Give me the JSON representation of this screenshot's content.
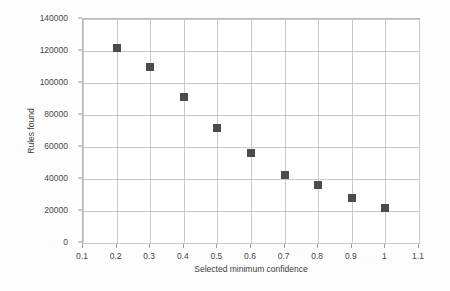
{
  "chart_data": {
    "type": "scatter",
    "title": "",
    "xlabel": "Selected minimum confidence",
    "ylabel": "Rules found",
    "xlim": [
      0.1,
      1.1
    ],
    "ylim": [
      0,
      140000
    ],
    "xticks": [
      "0.1",
      "0.2",
      "0.3",
      "0.4",
      "0.5",
      "0.6",
      "0.7",
      "0.8",
      "0.9",
      "1",
      "1.1"
    ],
    "xtick_values": [
      0.1,
      0.2,
      0.3,
      0.4,
      0.5,
      0.6,
      0.7,
      0.8,
      0.9,
      1.0,
      1.1
    ],
    "yticks": [
      "0",
      "20000",
      "40000",
      "60000",
      "80000",
      "100000",
      "120000",
      "140000"
    ],
    "ytick_values": [
      0,
      20000,
      40000,
      60000,
      80000,
      100000,
      120000,
      140000
    ],
    "grid": true,
    "legend": null,
    "marker": {
      "shape": "square",
      "color": "#4b4b4b",
      "size_px": 8
    },
    "x": [
      0.2,
      0.3,
      0.4,
      0.5,
      0.6,
      0.7,
      0.8,
      0.9,
      1.0
    ],
    "values": [
      122000,
      110000,
      91000,
      72000,
      56000,
      42500,
      36500,
      28000,
      22000
    ],
    "points": [
      {
        "x": 0.2,
        "y": 122000
      },
      {
        "x": 0.3,
        "y": 110000
      },
      {
        "x": 0.4,
        "y": 91000
      },
      {
        "x": 0.5,
        "y": 72000
      },
      {
        "x": 0.6,
        "y": 56000
      },
      {
        "x": 0.7,
        "y": 42500
      },
      {
        "x": 0.8,
        "y": 36500
      },
      {
        "x": 0.9,
        "y": 28000
      },
      {
        "x": 1.0,
        "y": 22000
      }
    ],
    "colors": {
      "marker": "#4b4b4b",
      "grid": "#c9c9c9",
      "frame": "#b9b9b9",
      "text": "#464646",
      "background": "#ffffff"
    }
  }
}
